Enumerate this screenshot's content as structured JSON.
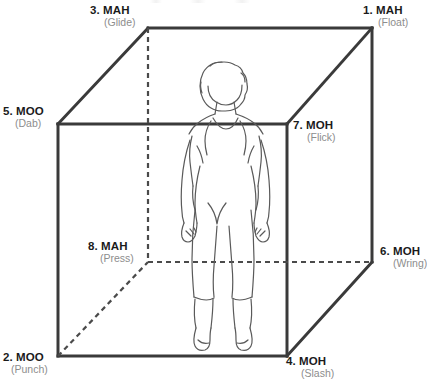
{
  "diagram": {
    "figure_alt": "standing human figure seen from behind inside the cube",
    "colors": {
      "cube_line": "#3a3a3a",
      "hidden_line": "#4a4a4a",
      "figure_line": "#5a5a5a",
      "label_main": "#1b1b1b",
      "label_sub": "#8d8d8d",
      "background": "#ffffff"
    },
    "geometry": {
      "front_top_left": [
        58,
        124
      ],
      "front_top_right": [
        287,
        124
      ],
      "front_bottom_left": [
        58,
        356
      ],
      "front_bottom_right": [
        287,
        356
      ],
      "back_top_left": [
        148,
        28
      ],
      "back_top_right": [
        372,
        28
      ],
      "back_bottom_left": [
        148,
        262
      ],
      "back_bottom_right": [
        372,
        262
      ]
    },
    "vertices": [
      {
        "id": "1",
        "number": "1. MAH",
        "effort": "(Float)",
        "corner": "back-top-right",
        "hidden": false
      },
      {
        "id": "2",
        "number": "2. MOO",
        "effort": "(Punch)",
        "corner": "front-bottom-left",
        "hidden": false
      },
      {
        "id": "3",
        "number": "3. MAH",
        "effort": "(Glide)",
        "corner": "back-top-left",
        "hidden": false
      },
      {
        "id": "4",
        "number": "4. MOH",
        "effort": "(Slash)",
        "corner": "front-bottom-right",
        "hidden": false
      },
      {
        "id": "5",
        "number": "5. MOO",
        "effort": "(Dab)",
        "corner": "front-top-left",
        "hidden": false
      },
      {
        "id": "6",
        "number": "6. MOH",
        "effort": "(Wring)",
        "corner": "back-bottom-right",
        "hidden": false
      },
      {
        "id": "7",
        "number": "7. MOH",
        "effort": "(Flick)",
        "corner": "front-top-right",
        "hidden": false
      },
      {
        "id": "8",
        "number": "8. MAH",
        "effort": "(Press)",
        "corner": "back-bottom-left",
        "hidden": true
      }
    ]
  }
}
